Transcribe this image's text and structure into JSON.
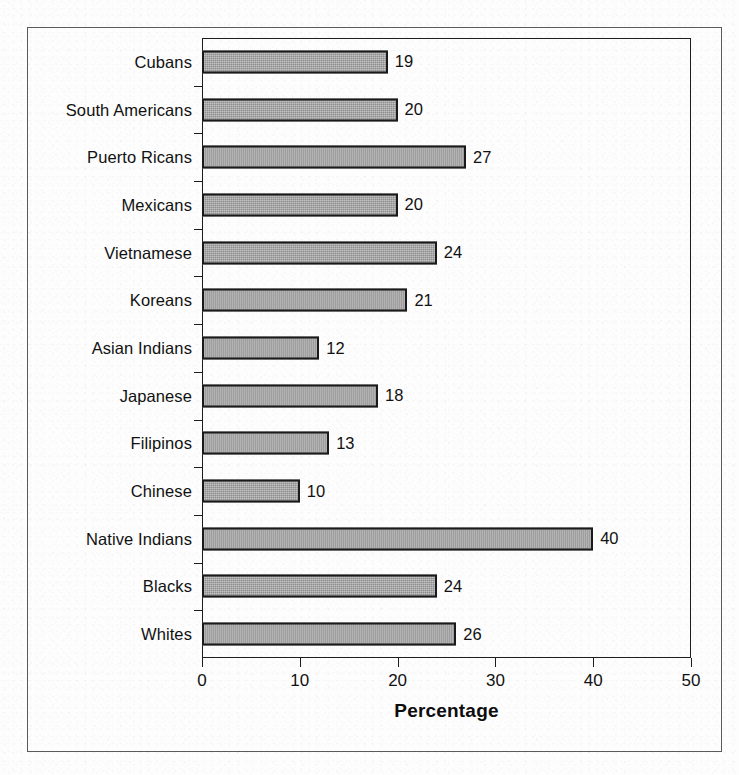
{
  "chart_data": {
    "type": "bar",
    "orientation": "horizontal",
    "title": "",
    "xlabel": "Percentage",
    "ylabel": "",
    "xlim": [
      0,
      50
    ],
    "xticks": [
      0,
      10,
      20,
      30,
      40,
      50
    ],
    "grid": false,
    "legend": false,
    "bar_color": "#8e8e8e",
    "bar_border_color": "#1a1a1a",
    "categories": [
      "Cubans",
      "South Americans",
      "Puerto Ricans",
      "Mexicans",
      "Vietnamese",
      "Koreans",
      "Asian Indians",
      "Japanese",
      "Filipinos",
      "Chinese",
      "Native Indians",
      "Blacks",
      "Whites"
    ],
    "values": [
      19,
      20,
      27,
      20,
      24,
      21,
      12,
      18,
      13,
      10,
      40,
      24,
      26
    ],
    "data_labels": [
      "19",
      "20",
      "27",
      "20",
      "24",
      "21",
      "12",
      "18",
      "13",
      "10",
      "40",
      "24",
      "26"
    ]
  },
  "axis": {
    "x_title": "Percentage",
    "tick_labels": [
      "0",
      "10",
      "20",
      "30",
      "40",
      "50"
    ]
  }
}
